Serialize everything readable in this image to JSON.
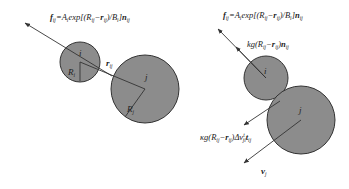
{
  "left_panel": {
    "formula": {
      "f": "f",
      "sub_ij": "ij",
      "eq": "=A",
      "sub_i": "i",
      "exp": "exp[(R",
      "sub_ij2": "ij",
      "minus": "−",
      "r": "r",
      "sub_ij3": "ij",
      "div": ")/B",
      "sub_i2": "i",
      "close": "]",
      "n": "n",
      "sub_ij4": "ij"
    },
    "circle_i_label": "i",
    "circle_j_label": "j",
    "radius_i_label": "R",
    "radius_i_sub": "i",
    "radius_j_label": "R",
    "radius_j_sub": "j",
    "distance_label": "r",
    "distance_sub": "ij"
  },
  "right_panel": {
    "formula": {
      "f": "f",
      "sub_ij": "ij",
      "eq": "=A",
      "sub_i": "i",
      "exp": "exp[(R",
      "sub_ij2": "ij",
      "minus": "−",
      "r": "r",
      "sub_ij3": "ij",
      "div": ")/B",
      "sub_i2": "i",
      "close": "]",
      "n": "n",
      "sub_ij4": "ij"
    },
    "body_force": {
      "pre": "kg(R",
      "sub_ij": "ij",
      "minus": "−",
      "r": "r",
      "sub_ij2": "ij",
      "close": ")",
      "n": "n",
      "sub_ij3": "ij"
    },
    "friction_force": {
      "pre": "κg(R",
      "sub_ij": "ij",
      "minus": "−",
      "r": "r",
      "sub_ij2": "ij",
      "mid": ")Δv",
      "sup": "t",
      "sub_ji": "ji",
      "t": "t",
      "sub_ij3": "ij"
    },
    "circle_i_label": "i",
    "circle_j_label": "j",
    "velocity_label": "v",
    "velocity_sub": "j"
  },
  "colors": {
    "circle_fill": "#8c8c8c",
    "stroke": "#333333"
  }
}
